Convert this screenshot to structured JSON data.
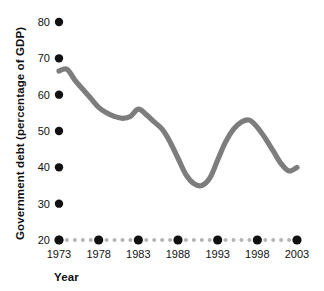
{
  "chart_data": {
    "type": "line",
    "title": "",
    "xlabel": "Year",
    "ylabel": "Government debt (percentage of GDP)",
    "xlim": [
      1973,
      2003
    ],
    "ylim": [
      20,
      80
    ],
    "grid": false,
    "legend": null,
    "line_color": "#7d7d7d",
    "axis_marker_color": "#111111",
    "axis_minor_marker_color": "#b5b5b5",
    "y_ticks": [
      20,
      30,
      40,
      50,
      60,
      70,
      80
    ],
    "y_tick_labels": [
      "20",
      "30",
      "40",
      "50",
      "60",
      "70",
      "80"
    ],
    "x_ticks": [
      1973,
      1978,
      1983,
      1988,
      1993,
      1998,
      2003
    ],
    "x_tick_labels": [
      "1973",
      "1978",
      "1983",
      "1988",
      "1993",
      "1998",
      "2003"
    ],
    "x_minor_ticks": [
      1974,
      1975,
      1976,
      1977,
      1979,
      1980,
      1981,
      1982,
      1984,
      1985,
      1986,
      1987,
      1989,
      1990,
      1991,
      1992,
      1994,
      1995,
      1996,
      1997,
      1999,
      2000,
      2001,
      2002
    ],
    "series": [
      {
        "name": "Government debt (percentage of GDP)",
        "x": [
          1973,
          1974,
          1975,
          1976,
          1977,
          1978,
          1979,
          1980,
          1981,
          1982,
          1983,
          1984,
          1985,
          1986,
          1987,
          1988,
          1989,
          1990,
          1991,
          1992,
          1993,
          1994,
          1995,
          1996,
          1997,
          1998,
          1999,
          2000,
          2001,
          2002,
          2003
        ],
        "values": [
          66.5,
          67.0,
          64.0,
          61.5,
          59.0,
          56.5,
          55.0,
          54.0,
          53.5,
          54.0,
          56.0,
          54.5,
          52.5,
          50.5,
          47.0,
          42.5,
          38.0,
          35.5,
          35.0,
          37.0,
          42.0,
          47.0,
          50.5,
          52.5,
          53.0,
          51.0,
          48.0,
          44.5,
          41.0,
          39.0,
          40.0
        ]
      }
    ]
  },
  "axis": {
    "y_title": "Government debt (percentage of GDP)",
    "x_title": "Year"
  }
}
